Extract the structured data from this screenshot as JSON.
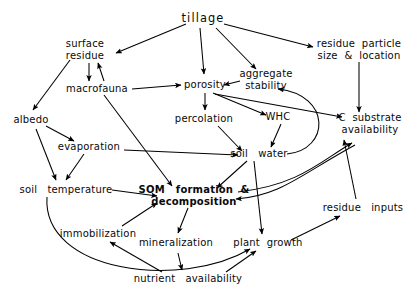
{
  "diagram": {
    "title": "tillage",
    "kind": "concept-map",
    "background_color": "#ffffff",
    "line_color": "#000000",
    "text_color": "#0a0a0a",
    "width": 417,
    "height": 306
  },
  "nodes": [
    {
      "id": "tillage",
      "label": "tillage",
      "x": 203,
      "y": 19,
      "size": "lg",
      "bold": false,
      "wide": true
    },
    {
      "id": "surface",
      "label": "surface\nresidue",
      "x": 85,
      "y": 50,
      "size": "md",
      "bold": false,
      "wide": false
    },
    {
      "id": "residue_pls",
      "label": "residue  particle\nsize  &  location",
      "x": 359,
      "y": 50,
      "size": "md",
      "bold": false,
      "wide": false
    },
    {
      "id": "macrofauna",
      "label": "macrofauna",
      "x": 97,
      "y": 89,
      "size": "md",
      "bold": false,
      "wide": false
    },
    {
      "id": "porosity",
      "label": "porosity",
      "x": 205,
      "y": 85,
      "size": "md",
      "bold": false,
      "wide": false
    },
    {
      "id": "aggregate",
      "label": "aggregate\nstability",
      "x": 266,
      "y": 80,
      "size": "md",
      "bold": false,
      "wide": false
    },
    {
      "id": "albedo",
      "label": "albedo",
      "x": 31,
      "y": 120,
      "size": "md",
      "bold": false,
      "wide": false
    },
    {
      "id": "percolation",
      "label": "percolation",
      "x": 204,
      "y": 119,
      "size": "md",
      "bold": false,
      "wide": false
    },
    {
      "id": "whc",
      "label": "WHC",
      "x": 278,
      "y": 117,
      "size": "md",
      "bold": false,
      "wide": false
    },
    {
      "id": "c_substrate",
      "label": "C  substrate\navailability",
      "x": 370,
      "y": 124,
      "size": "md",
      "bold": false,
      "wide": false
    },
    {
      "id": "evaporation",
      "label": "evaporation",
      "x": 89,
      "y": 147,
      "size": "md",
      "bold": false,
      "wide": false
    },
    {
      "id": "soil_water",
      "label": "soil   water",
      "x": 259,
      "y": 154,
      "size": "md",
      "bold": false,
      "wide": false
    },
    {
      "id": "soil_temp",
      "label": "soil   temperature",
      "x": 66,
      "y": 190,
      "size": "md",
      "bold": false,
      "wide": false
    },
    {
      "id": "som",
      "label": "SOM   formation  &\ndecomposition",
      "x": 194,
      "y": 196,
      "size": "md",
      "bold": true,
      "wide": false
    },
    {
      "id": "residue_inputs",
      "label": "residue   inputs",
      "x": 363,
      "y": 208,
      "size": "md",
      "bold": false,
      "wide": false
    },
    {
      "id": "immobilization",
      "label": "immobilization",
      "x": 98,
      "y": 234,
      "size": "md",
      "bold": false,
      "wide": false
    },
    {
      "id": "mineralization",
      "label": "mineralization",
      "x": 176,
      "y": 243,
      "size": "md",
      "bold": false,
      "wide": false
    },
    {
      "id": "plant_growth",
      "label": "plant  growth",
      "x": 268,
      "y": 243,
      "size": "md",
      "bold": false,
      "wide": false
    },
    {
      "id": "nutrient",
      "label": "nutrient   availability",
      "x": 188,
      "y": 279,
      "size": "md",
      "bold": false,
      "wide": false
    }
  ],
  "edges": [
    {
      "from": "tillage",
      "to": "surface",
      "d": "M 186 24 L 116 53",
      "arrow": true
    },
    {
      "from": "tillage",
      "to": "residue_pls",
      "d": "M 224 24 L 313 47",
      "arrow": true
    },
    {
      "from": "tillage",
      "to": "porosity",
      "d": "M 200 28 L 204 74",
      "arrow": true
    },
    {
      "from": "tillage",
      "to": "aggregate",
      "d": "M 216 28 L 256 69",
      "arrow": true
    },
    {
      "from": "surface",
      "to": "albedo",
      "d": "M 70 60 L 33 110",
      "arrow": true
    },
    {
      "from": "surface",
      "to": "macrofauna",
      "d": "M 89 63 L 89 81",
      "arrow": true
    },
    {
      "from": "macrofauna",
      "to": "surface",
      "d": "M 104 81 L 98 63",
      "arrow": true
    },
    {
      "from": "macrofauna",
      "to": "porosity",
      "d": "M 132 89 L 181 85",
      "arrow": true
    },
    {
      "from": "macrofauna",
      "to": "som",
      "d": "M 104 95 L 172 186",
      "arrow": true
    },
    {
      "from": "aggregate",
      "to": "porosity",
      "d": "M 240 81 L 224 85",
      "arrow": true
    },
    {
      "from": "porosity",
      "to": "percolation",
      "d": "M 205 93 L 205 110",
      "arrow": true
    },
    {
      "from": "porosity",
      "to": "whc",
      "d": "M 213 93 L 266 115",
      "arrow": true
    },
    {
      "from": "porosity",
      "to": "c_substrate",
      "d": "M 215 94 L 342 117",
      "arrow": true
    },
    {
      "from": "residue_pls",
      "to": "c_substrate",
      "d": "M 359 62 L 359 112",
      "arrow": true
    },
    {
      "from": "albedo",
      "to": "evaporation",
      "d": "M 46 126 L 74 141",
      "arrow": true
    },
    {
      "from": "albedo",
      "to": "soil_temp",
      "d": "M 36 129 L 56 180",
      "arrow": true
    },
    {
      "from": "evaporation",
      "to": "soil_temp",
      "d": "M 84 154 L 66 180",
      "arrow": true
    },
    {
      "from": "evaporation",
      "to": "soil_water",
      "d": "M 124 150 L 238 155",
      "arrow": true
    },
    {
      "from": "percolation",
      "to": "soil_water",
      "d": "M 218 126 L 242 151",
      "arrow": true
    },
    {
      "from": "whc",
      "to": "soil_water",
      "d": "M 281 124 L 271 147",
      "arrow": true
    },
    {
      "from": "soil_water",
      "to": "som",
      "d": "M 247 161 L 217 188",
      "arrow": true
    },
    {
      "from": "soil_water",
      "to": "plant_growth",
      "d": "M 254 161 L 262 234",
      "arrow": true
    },
    {
      "from": "soil_water",
      "to": "aggregate",
      "d": "M 287 154 C 330 150 332 95 278 89",
      "arrow": true
    },
    {
      "from": "soil_temp",
      "to": "som",
      "d": "M 112 190 L 157 196",
      "arrow": true
    },
    {
      "from": "soil_temp",
      "to": "plant_growth",
      "d": "M 47 197 C 42 272 180 290 250 249",
      "arrow": true
    },
    {
      "from": "immobilization",
      "to": "som",
      "d": "M 122 226 L 157 203",
      "arrow": true
    },
    {
      "from": "som",
      "to": "mineralization",
      "d": "M 188 208 L 178 233",
      "arrow": true
    },
    {
      "from": "som",
      "to": "c_substrate",
      "d": "M 238 192 C 300 185 322 160 352 143",
      "arrow": true
    },
    {
      "from": "c_substrate",
      "to": "som",
      "d": "M 355 145 C 300 175 280 196 236 199",
      "arrow": true
    },
    {
      "from": "mineralization",
      "to": "nutrient",
      "d": "M 178 253 L 182 270",
      "arrow": true
    },
    {
      "from": "nutrient",
      "to": "immobilization",
      "d": "M 162 272 L 110 242",
      "arrow": true
    },
    {
      "from": "nutrient",
      "to": "plant_growth",
      "d": "M 226 272 L 256 251",
      "arrow": true
    },
    {
      "from": "plant_growth",
      "to": "residue_inputs",
      "d": "M 291 240 L 340 216",
      "arrow": true
    },
    {
      "from": "residue_inputs",
      "to": "c_substrate",
      "d": "M 356 199 L 344 140",
      "arrow": true
    }
  ]
}
